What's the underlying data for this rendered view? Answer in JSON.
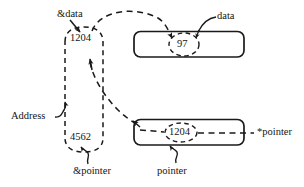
{
  "diagram": {
    "colors": {
      "stroke": "#1a1a1a",
      "text": "#141414",
      "background": "#ffffff"
    },
    "memory_cells": [
      {
        "id": "data-cell",
        "value": "97",
        "annotation": "data",
        "address_label": "1204"
      },
      {
        "id": "pointer-cell",
        "value": "1204",
        "annotation": "pointer",
        "deref_label": "*pointer",
        "address_label": "4562"
      }
    ],
    "addresses": {
      "group_label": "Address",
      "data_address": "1204",
      "pointer_address": "4562",
      "data_address_label": "&data",
      "pointer_address_label": "&pointer"
    },
    "labels": {
      "amp_data": "&data",
      "amp_pointer": "&pointer",
      "address": "Address",
      "data": "data",
      "pointer": "pointer",
      "star_pointer": "*pointer",
      "value_1204_top": "1204",
      "value_4562": "4562",
      "value_97": "97",
      "value_1204_cell": "1204"
    }
  }
}
